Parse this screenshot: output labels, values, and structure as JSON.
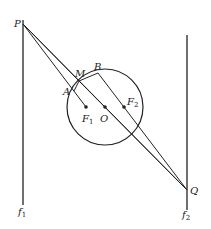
{
  "diagram": {
    "labels": {
      "P": "P",
      "Q": "Q",
      "M": "M",
      "A": "A",
      "B": "B",
      "O": "O",
      "F1": "F",
      "F1_sub": "1",
      "F2": "F",
      "F2_sub": "2",
      "f1": "f",
      "f1_sub": "1",
      "f2": "f",
      "f2_sub": "2"
    },
    "points": {
      "P": [
        23,
        24
      ],
      "Q": [
        187,
        190
      ],
      "O": [
        105,
        107
      ],
      "F1": [
        86,
        107
      ],
      "F2": [
        124,
        107
      ],
      "M": [
        79,
        81
      ],
      "A": [
        74,
        91
      ],
      "B": [
        98,
        73
      ]
    },
    "circle": {
      "center": [
        105,
        107
      ],
      "radius": 38
    },
    "lines": {
      "f1": {
        "x": 23,
        "y1": 20,
        "y2": 205
      },
      "f2": {
        "x": 187,
        "y1": 35,
        "y2": 210
      }
    },
    "stroke_color": "#222222"
  }
}
